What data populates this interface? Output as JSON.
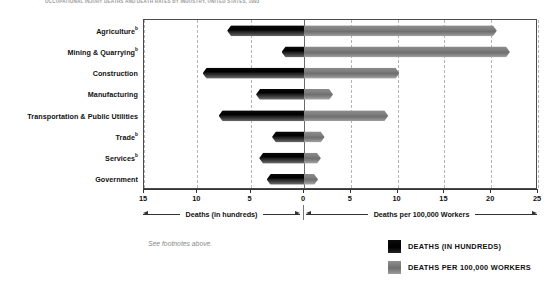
{
  "chart_data": {
    "type": "bar",
    "title": "OCCUPATIONAL INJURY DEATHS AND DEATH RATES BY INDUSTRY, UNITED STATES, 1993",
    "orientation": "horizontal-diverging",
    "categories": [
      "Agriculture",
      "Mining & Quarrying",
      "Construction",
      "Manufacturing",
      "Transportation & Public Utilities",
      "Trade",
      "Services",
      "Government"
    ],
    "category_footnote_marks": [
      "b",
      "b",
      "",
      "",
      "",
      "b",
      "b",
      ""
    ],
    "series": [
      {
        "name": "DEATHS (IN HUNDREDS)",
        "direction": "left",
        "color": "#000000",
        "values": [
          7.2,
          2.1,
          9.5,
          4.5,
          8.0,
          3.0,
          4.2,
          3.5
        ]
      },
      {
        "name": "DEATHS PER 100,000 WORKERS",
        "direction": "right",
        "color": "#757575",
        "values": [
          20.6,
          22.0,
          10.2,
          3.1,
          9.0,
          2.2,
          1.8,
          1.5
        ]
      }
    ],
    "xlabel_left": "Deaths (in hundreds)",
    "xlabel_right": "Deaths per 100,000 Workers",
    "ylabel": "",
    "left_axis_max": 15,
    "right_axis_max": 25,
    "tick_labels": [
      "15",
      "10",
      "5",
      "0",
      "5",
      "10",
      "15",
      "20",
      "25"
    ],
    "tick_values": [
      -15,
      -10,
      -5,
      0,
      5,
      10,
      15,
      20,
      25
    ],
    "grid": true,
    "legend_position": "bottom-right"
  },
  "footnote": {
    "text": "See footnotes above."
  },
  "legend": {
    "items": [
      {
        "label": "DEATHS (IN HUNDREDS)",
        "swatch": "black"
      },
      {
        "label": "DEATHS PER 100,000 WORKERS",
        "swatch": "gray"
      }
    ]
  }
}
